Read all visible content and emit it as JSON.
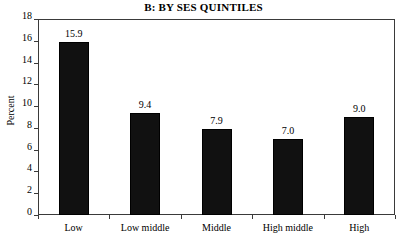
{
  "chart_data": {
    "type": "bar",
    "title": "B: BY SES QUINTILES",
    "xlabel": "",
    "ylabel": "Percent",
    "categories": [
      "Low",
      "Low middle",
      "Middle",
      "High middle",
      "High"
    ],
    "values": [
      15.9,
      9.4,
      7.9,
      7.0,
      9.0
    ],
    "value_labels": [
      "15.9",
      "9.4",
      "7.9",
      "7.0",
      "9.0"
    ],
    "ylim": [
      0,
      18
    ],
    "yticks": [
      0,
      2,
      4,
      6,
      8,
      10,
      12,
      14,
      16,
      18
    ],
    "ytick_labels": [
      "0",
      "2",
      "4",
      "6",
      "8",
      "10",
      "12",
      "14",
      "16",
      "18"
    ],
    "grid": false,
    "legend": null,
    "bar_color": "#111111",
    "axis_color": "#3a3a3a",
    "background": "#ffffff"
  }
}
